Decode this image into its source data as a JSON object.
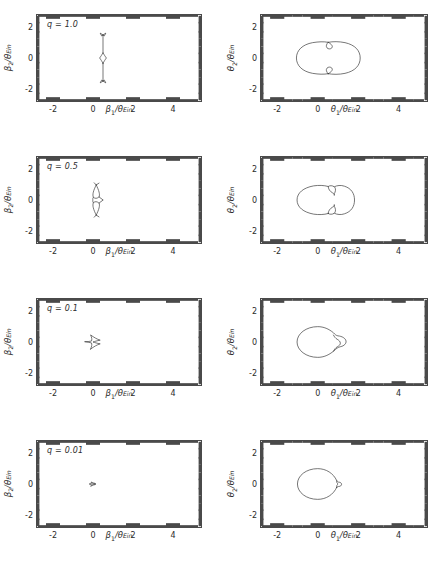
{
  "figure": {
    "rows": [
      {
        "q_label": "q = 1.0"
      },
      {
        "q_label": "q = 0.5"
      },
      {
        "q_label": "q = 0.1"
      },
      {
        "q_label": "q = 0.01"
      }
    ],
    "left_column": {
      "xlabel_num": "β",
      "xlabel_sub": "1",
      "xlabel_den": "θ",
      "xlabel_den_sub": "Ein",
      "ylabel_num": "β",
      "ylabel_sub": "2",
      "ylabel_den": "θ",
      "ylabel_den_sub": "Ein"
    },
    "right_column": {
      "xlabel_num": "θ",
      "xlabel_sub": "1",
      "xlabel_den": "θ",
      "xlabel_den_sub": "Ein",
      "ylabel_num": "θ",
      "ylabel_sub": "2",
      "ylabel_den": "θ",
      "ylabel_den_sub": "Ein"
    },
    "xticks": [
      "-2",
      "0",
      "2",
      "4"
    ],
    "yticks": [
      "2",
      "0",
      "-2"
    ],
    "curve_color": "#3c3c3c",
    "frame_color": "#4a4a4a"
  },
  "chart_data": {
    "type": "line",
    "title": "",
    "panel_count": 8,
    "grid": false,
    "legend": null,
    "xlim": [
      -2.8,
      5.4
    ],
    "ylim": [
      -2.8,
      2.8
    ],
    "xticks": [
      -2,
      0,
      2,
      4
    ],
    "yticks": [
      -2,
      0,
      2
    ],
    "minor_tick_spacing": 0.5,
    "columns": [
      {
        "name": "source-plane-caustics",
        "xlabel": "β1/θEin",
        "ylabel": "β2/θEin"
      },
      {
        "name": "image-plane-critical-curves",
        "xlabel": "θ1/θEin",
        "ylabel": "θ2/θEin"
      }
    ],
    "panels": [
      {
        "row": 0,
        "q": 1.0,
        "annotation": "q = 1.0",
        "caustic": {
          "description": "vertical line caustic with central astroid and butterfly cusps at both ends",
          "center_x": 0.5,
          "extent_y": [
            -1.5,
            1.5
          ],
          "astroid_half_width": 0.17,
          "astroid_half_height": 0.33
        },
        "critical_curve": {
          "description": "symmetric peanut with two inner teardrop loops on the axis",
          "outer_x_range": [
            -1.05,
            2.1
          ],
          "outer_y_range": [
            -1.05,
            1.05
          ],
          "waist_x": 0.52
        }
      },
      {
        "row": 1,
        "q": 0.5,
        "annotation": "q = 0.5",
        "caustic": {
          "description": "curved tangential caustic with central astroid, two outer cusps",
          "center_x": 0.25,
          "extent_y": [
            -1.0,
            1.0
          ],
          "astroid_half_width": 0.26,
          "astroid_half_height": 0.2
        },
        "critical_curve": {
          "description": "asymmetric peanut, large left lobe and smaller right lobe",
          "outer_x_range": [
            -1.05,
            1.82
          ],
          "outer_y_range": [
            -0.95,
            0.95
          ],
          "waist_x": 0.58
        }
      },
      {
        "row": 2,
        "q": 0.1,
        "annotation": "q = 0.1",
        "caustic": {
          "description": "four-cusped astroid caustic offset right of origin",
          "center_x": 0.07,
          "extent_y": [
            -0.45,
            0.45
          ],
          "astroid_half_width": 0.42,
          "astroid_half_height": 0.45
        },
        "critical_curve": {
          "description": "large circle of radius ~1 with small bump lobe on right",
          "outer_x_range": [
            -1.05,
            1.42
          ],
          "outer_y_range": [
            -1.0,
            1.0
          ],
          "bump_center_x": 1.12
        }
      },
      {
        "row": 3,
        "q": 0.01,
        "annotation": "q = 0.01",
        "caustic": {
          "description": "very small astroid caustic near the origin",
          "center_x": 0.0,
          "extent_y": [
            -0.12,
            0.12
          ],
          "astroid_half_width": 0.13,
          "astroid_half_height": 0.12
        },
        "critical_curve": {
          "description": "circle of radius ~1 with a tiny lobe attached on the right edge",
          "outer_x_range": [
            -1.0,
            1.12
          ],
          "outer_y_range": [
            -1.0,
            1.0
          ],
          "bump_center_x": 1.02
        }
      }
    ]
  }
}
